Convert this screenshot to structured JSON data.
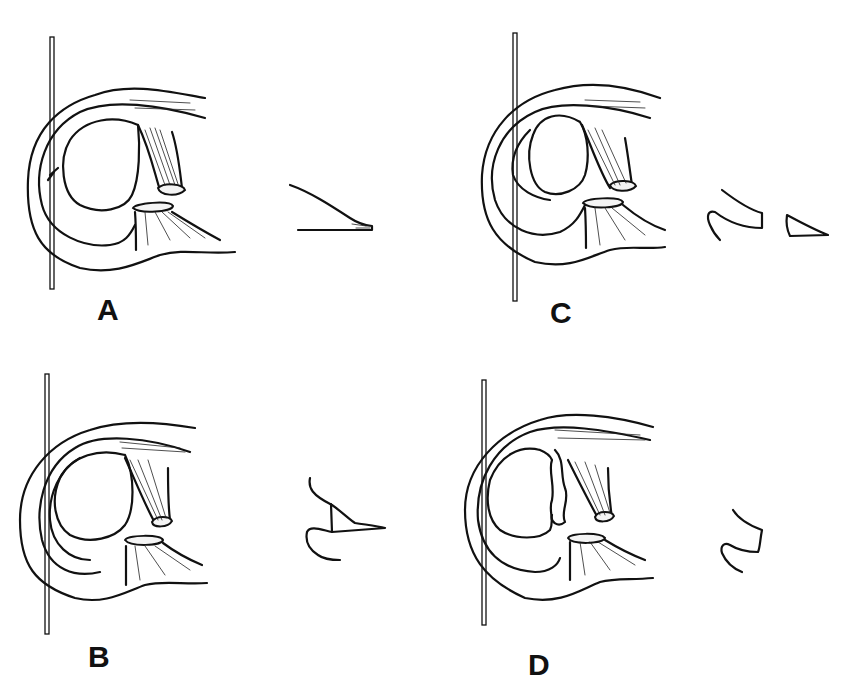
{
  "figure": {
    "panels": [
      {
        "id": "A",
        "label": "A",
        "tear_profile": "wedge-with-hatched-tip"
      },
      {
        "id": "B",
        "label": "B",
        "tear_profile": "vertical-split-wedge"
      },
      {
        "id": "C",
        "label": "C",
        "tear_profile": "separated-fragment"
      },
      {
        "id": "D",
        "label": "D",
        "tear_profile": "remnant-only"
      }
    ],
    "colors": {
      "line": "#111111",
      "background": "#ffffff"
    }
  }
}
